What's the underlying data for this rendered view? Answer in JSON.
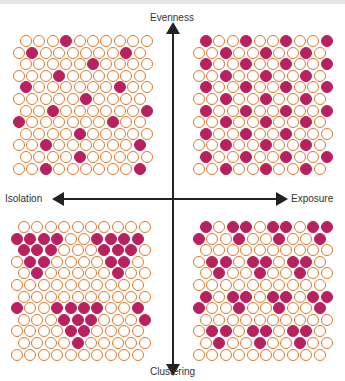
{
  "diagram": {
    "axes": {
      "top": "Evenness",
      "bottom": "Clustering",
      "left": "Isolation",
      "right": "Exposure"
    },
    "colors": {
      "ring": "#e07a2a",
      "filled": "#b8215e",
      "axis": "#222222"
    },
    "grid": {
      "rows": 12,
      "cols": 10
    },
    "quadrants": [
      {
        "name": "top-left",
        "description": "Even + Isolated: sparse scattered filled circles",
        "filled": [
          [
            3
          ],
          [
            1,
            8
          ],
          [
            5
          ],
          [
            3
          ],
          [
            0,
            7
          ],
          [
            5
          ],
          [
            2,
            9
          ],
          [
            0,
            7
          ],
          [
            4
          ],
          [
            2,
            9
          ],
          [
            4
          ],
          [
            2,
            9
          ]
        ]
      },
      {
        "name": "top-right",
        "description": "Even + Exposed: regular diagonal lattice of filled circles",
        "filled": [
          [
            0,
            3,
            6,
            9
          ],
          [
            2,
            5,
            8
          ],
          [
            0,
            3,
            6,
            9
          ],
          [
            2,
            5,
            8
          ],
          [
            0,
            3,
            6,
            9
          ],
          [
            2,
            5,
            8
          ],
          [
            0,
            3,
            6,
            9
          ],
          [
            2,
            5,
            8
          ],
          [
            0,
            3,
            6
          ],
          [
            2,
            5,
            8
          ],
          [
            0,
            3,
            6,
            9
          ],
          [
            2,
            5,
            8
          ]
        ]
      },
      {
        "name": "bottom-left",
        "description": "Clustered + Isolated: filled circles grouped in triangles",
        "filled": [
          [],
          [
            0,
            1,
            2,
            3,
            6,
            7,
            8,
            9
          ],
          [
            0,
            1,
            2,
            6,
            7,
            8
          ],
          [
            1,
            2,
            7,
            8
          ],
          [
            1,
            7
          ],
          [],
          [],
          [
            0,
            3,
            4,
            5,
            6,
            9
          ],
          [
            3,
            4,
            5,
            9
          ],
          [
            4,
            5
          ],
          [
            4
          ],
          []
        ]
      },
      {
        "name": "bottom-right",
        "description": "Clustered + Exposed: small clusters spread throughout",
        "filled": [
          [
            0,
            2,
            3,
            5,
            6,
            8,
            9
          ],
          [
            0,
            3,
            6,
            9
          ],
          [],
          [
            1,
            2,
            4,
            5,
            7,
            8
          ],
          [
            1,
            4,
            7
          ],
          [],
          [
            0,
            2,
            3,
            5,
            6,
            8,
            9
          ],
          [
            0,
            3,
            6,
            9
          ],
          [],
          [
            1,
            2,
            4,
            5,
            7,
            8
          ],
          [
            1,
            4,
            7
          ],
          []
        ]
      }
    ]
  }
}
